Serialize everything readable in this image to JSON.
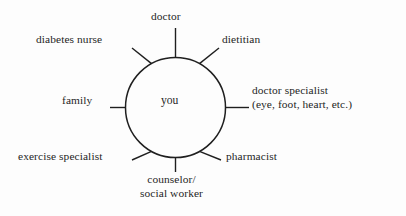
{
  "diagram": {
    "type": "hub-and-spoke",
    "title": "",
    "center": {
      "label": "you"
    },
    "colors": {
      "background": "#fdfdfd",
      "stroke": "#1f1f1f",
      "text": "#1f1f1f"
    },
    "spokes": [
      {
        "id": "doctor",
        "label": "doctor",
        "position": "top",
        "angle_deg": 90
      },
      {
        "id": "dietitian",
        "label": "dietitian",
        "position": "top-right",
        "angle_deg": 45
      },
      {
        "id": "doctor-specialist",
        "label": "doctor specialist",
        "label_line2": "(eye, foot, heart, etc.)",
        "position": "right",
        "angle_deg": 0
      },
      {
        "id": "pharmacist",
        "label": "pharmacist",
        "position": "bottom-right",
        "angle_deg": -45
      },
      {
        "id": "counselor",
        "label": "counselor/",
        "label_line2": "social worker",
        "position": "bottom",
        "angle_deg": -90
      },
      {
        "id": "exercise-specialist",
        "label": "exercise specialist",
        "position": "bottom-left",
        "angle_deg": -135
      },
      {
        "id": "family",
        "label": "family",
        "position": "left",
        "angle_deg": 180
      },
      {
        "id": "diabetes-nurse",
        "label": "diabetes nurse",
        "position": "top-left",
        "angle_deg": 135
      }
    ]
  }
}
